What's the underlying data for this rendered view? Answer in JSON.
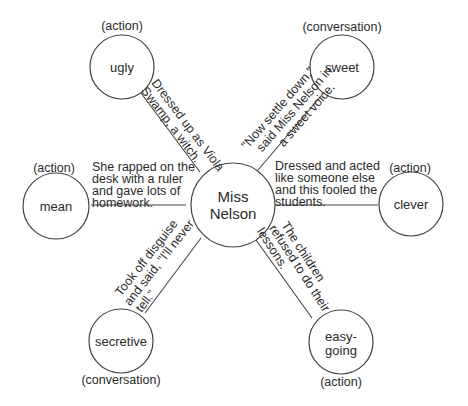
{
  "center": {
    "label_line1": "Miss",
    "label_line2": "Nelson"
  },
  "traits": [
    {
      "id": "ugly",
      "label_line1": "ugly",
      "label_line2": "",
      "type": "(action)",
      "evidence": [
        "Dressed up as Viola",
        "Swamp, a witch."
      ]
    },
    {
      "id": "sweet",
      "label_line1": "sweet",
      "label_line2": "",
      "type": "(conversation)",
      "evidence": [
        "\"Now settle down,\"",
        "said Miss Nelson in",
        "a sweet voice."
      ]
    },
    {
      "id": "mean",
      "label_line1": "mean",
      "label_line2": "",
      "type": "(action)",
      "evidence": [
        "She rapped on the",
        "desk with a ruler",
        "and gave lots of",
        "homework."
      ]
    },
    {
      "id": "clever",
      "label_line1": "clever",
      "label_line2": "",
      "type": "(action)",
      "evidence": [
        "Dressed and acted",
        "like someone else",
        "and this fooled the",
        "students."
      ]
    },
    {
      "id": "secretive",
      "label_line1": "secretive",
      "label_line2": "",
      "type": "(conversation)",
      "evidence": [
        "Took off disguise",
        "and said, \"I'll never",
        "tell.\""
      ]
    },
    {
      "id": "easy-going",
      "label_line1": "easy-",
      "label_line2": "going",
      "type": "(action)",
      "evidence": [
        "The children",
        "refused to do their",
        "lessons."
      ]
    }
  ]
}
